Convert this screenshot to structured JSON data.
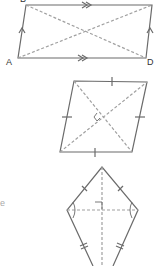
{
  "figures": {
    "parallelogram": {
      "labels": {
        "top_left": "B",
        "bottom_left": "A",
        "bottom_right": "D"
      },
      "marks": "parallel-arrows",
      "diagonals": "dashed"
    },
    "rhombus": {
      "marks": "equal-side-ticks",
      "diagonals": "dashed",
      "center_mark": "right-angle"
    },
    "kite": {
      "marks": "single-and-double-ticks",
      "diagonals": "dashed",
      "center_mark": "right-angle",
      "angle_marks": "equal-angle-arcs"
    }
  },
  "edge_text": "e",
  "colors": {
    "stroke": "#6b6b6b",
    "dash": "#9a9a9a",
    "text": "#333333"
  }
}
